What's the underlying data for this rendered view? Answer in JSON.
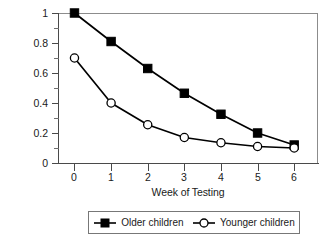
{
  "chart_data": {
    "type": "line",
    "title": "",
    "xlabel": "Week of Testing",
    "ylabel": "Correct-Response Probability",
    "x": [
      0,
      1,
      2,
      3,
      4,
      5,
      6
    ],
    "xtick_labels": [
      "0",
      "1",
      "2",
      "3",
      "4",
      "5",
      "6"
    ],
    "ytick_labels": [
      "0",
      "0.2",
      "0.4",
      "0.6",
      "0.8",
      "1"
    ],
    "ytick_values": [
      0,
      0.2,
      0.4,
      0.6,
      0.8,
      1
    ],
    "yminor_values": [
      0.1,
      0.3,
      0.5,
      0.7,
      0.9
    ],
    "xlim": [
      -0.45,
      6.65
    ],
    "ylim": [
      0,
      1
    ],
    "grid": false,
    "legend_position": "below-center",
    "frame": true,
    "series": [
      {
        "name": "Older children",
        "marker": "filled-square",
        "color": "#000000",
        "values": [
          1.0,
          0.81,
          0.63,
          0.465,
          0.325,
          0.2,
          0.12
        ]
      },
      {
        "name": "Younger children",
        "marker": "open-circle",
        "color": "#000000",
        "values": [
          0.7,
          0.4,
          0.255,
          0.17,
          0.135,
          0.11,
          0.1
        ]
      }
    ]
  },
  "legend": {
    "entries": [
      {
        "label": "Older children",
        "marker": "filled-square-marker"
      },
      {
        "label": "Younger children",
        "marker": "open-circle-marker"
      }
    ]
  }
}
